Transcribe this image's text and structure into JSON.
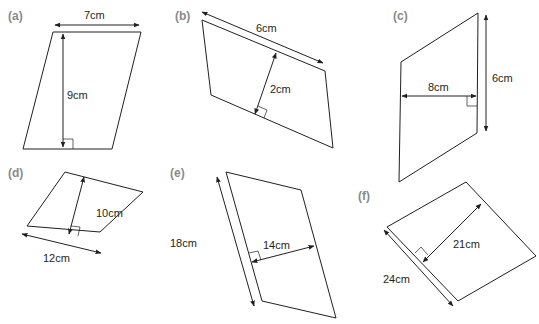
{
  "figures": [
    {
      "id": "a",
      "part_label": "(a)",
      "base_label": "7cm",
      "height_label": "9cm",
      "base": 7,
      "height": 9,
      "unit": "cm"
    },
    {
      "id": "b",
      "part_label": "(b)",
      "base_label": "6cm",
      "height_label": "2cm",
      "base": 6,
      "height": 2,
      "unit": "cm"
    },
    {
      "id": "c",
      "part_label": "(c)",
      "base_label": "8cm",
      "height_label": "6cm",
      "base": 8,
      "height": 6,
      "unit": "cm"
    },
    {
      "id": "d",
      "part_label": "(d)",
      "base_label": "12cm",
      "height_label": "10cm",
      "base": 12,
      "height": 10,
      "unit": "cm"
    },
    {
      "id": "e",
      "part_label": "(e)",
      "base_label": "18cm",
      "height_label": "14cm",
      "base": 18,
      "height": 14,
      "unit": "cm"
    },
    {
      "id": "f",
      "part_label": "(f)",
      "base_label": "24cm",
      "height_label": "21cm",
      "base": 24,
      "height": 21,
      "unit": "cm"
    }
  ],
  "colors": {
    "line": "#231f20",
    "part_label": "#8a8a8a"
  }
}
